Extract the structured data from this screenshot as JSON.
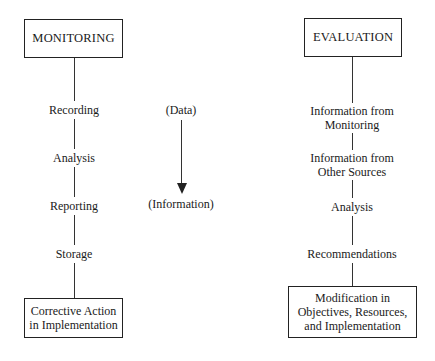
{
  "monitoring": {
    "title": "MONITORING",
    "steps": [
      "Recording",
      "Analysis",
      "Reporting",
      "Storage"
    ],
    "outcome_line1": "Corrective Action",
    "outcome_line2": "in Implementation"
  },
  "flow": {
    "start": "(Data)",
    "end": "(Information)",
    "arrow_icon": "down-arrow"
  },
  "evaluation": {
    "title": "EVALUATION",
    "steps": [
      {
        "line1": "Information from",
        "line2": "Monitoring"
      },
      {
        "line1": "Information from",
        "line2": "Other Sources"
      },
      {
        "line1": "Analysis"
      },
      {
        "line1": "Recommendations"
      }
    ],
    "outcome_line1": "Modification in",
    "outcome_line2": "Objectives, Resources,",
    "outcome_line3": "and Implementation"
  },
  "colors": {
    "line": "#333333",
    "text": "#1a1a1a",
    "background": "#ffffff"
  }
}
